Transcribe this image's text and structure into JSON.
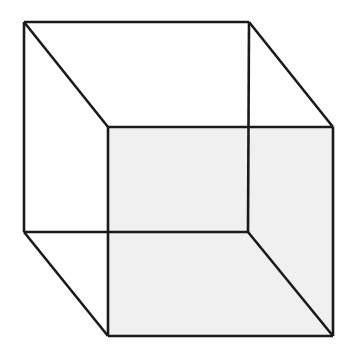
{
  "figure": {
    "kind": "line-drawing",
    "canvas": {
      "width": 349,
      "height": 358,
      "background_color": "#ffffff"
    },
    "style": {
      "edge_color": "#1a1a1a",
      "edge_width": 2.6,
      "shaded_face_color": "#f0f0f0",
      "unshaded_face_color": "#ffffff"
    },
    "vertices": {
      "back_top_left": [
        24,
        22
      ],
      "back_top_right": [
        249,
        22
      ],
      "back_bottom_left": [
        24,
        232
      ],
      "back_bottom_right": [
        248,
        232
      ],
      "front_top_left": [
        108,
        127
      ],
      "front_top_right": [
        333,
        127
      ],
      "front_bottom_left": [
        108,
        336
      ],
      "front_bottom_right": [
        333,
        336
      ]
    },
    "faces": [
      {
        "name": "front-face",
        "shaded": true,
        "fill": "#f0f0f0",
        "points": "108,127 333,127 333,336 108,336"
      },
      {
        "name": "right-face",
        "shaded": true,
        "fill": "#f0f0f0",
        "points": "248,232 333,127 333,336"
      }
    ],
    "edges": [
      {
        "name": "back-top-edge",
        "points": "24,22 249,22"
      },
      {
        "name": "back-left-vertical-edge",
        "points": "24,22 24,232"
      },
      {
        "name": "back-bottom-edge",
        "points": "24,232 248,232"
      },
      {
        "name": "back-right-vertical-edge",
        "points": "249,22 248,232"
      },
      {
        "name": "top-left-diagonal-edge",
        "points": "24,22 108,127"
      },
      {
        "name": "top-right-diagonal-edge",
        "points": "249,22 333,127"
      },
      {
        "name": "bottom-left-diagonal-edge",
        "points": "24,232 108,336"
      },
      {
        "name": "bottom-right-diagonal-edge",
        "points": "248,232 333,336"
      },
      {
        "name": "front-top-edge",
        "points": "108,127 333,127"
      },
      {
        "name": "front-left-vertical-edge",
        "points": "108,127 108,336"
      },
      {
        "name": "front-bottom-edge",
        "points": "108,336 333,336"
      },
      {
        "name": "front-right-vertical-edge",
        "points": "333,127 333,336"
      }
    ]
  }
}
